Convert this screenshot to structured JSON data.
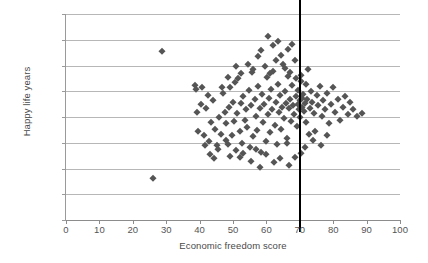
{
  "chart_data": {
    "type": "scatter",
    "title": "",
    "xlabel": "Economic freedom score",
    "ylabel": "Happy life years",
    "xlim": [
      0,
      100
    ],
    "ylim": [
      0,
      80
    ],
    "xticks": [
      0,
      10,
      20,
      30,
      40,
      50,
      60,
      70,
      80,
      90,
      100
    ],
    "xtick_labels": [
      "0",
      "10",
      "20",
      "30",
      "40",
      "50",
      "60",
      "70",
      "80",
      "90",
      "100"
    ],
    "yticks": [
      0,
      10,
      20,
      30,
      40,
      50,
      60,
      70,
      80
    ],
    "ytick_labels": [
      "0.00",
      "10.00",
      "20.00",
      "30.00",
      "40.00",
      "50.00",
      "60.00",
      "70.00",
      "80.00"
    ],
    "grid": "horizontal",
    "legend": null,
    "marker": "diamond",
    "marker_color": "#555555",
    "annotations": [
      {
        "name": "vertical-reference-line",
        "type": "vline",
        "x": 70,
        "color": "#000000",
        "width_px": 2.4
      }
    ],
    "points": [
      [
        26.0,
        16.5
      ],
      [
        28.8,
        65.5
      ],
      [
        38.5,
        52.3
      ],
      [
        38.9,
        51.0
      ],
      [
        39.2,
        41.8
      ],
      [
        40.5,
        45.0
      ],
      [
        41.2,
        33.0
      ],
      [
        42.0,
        43.5
      ],
      [
        42.8,
        30.5
      ],
      [
        43.5,
        38.0
      ],
      [
        44.0,
        46.5
      ],
      [
        44.6,
        35.5
      ],
      [
        45.2,
        29.0
      ],
      [
        45.8,
        40.0
      ],
      [
        46.4,
        33.5
      ],
      [
        47.0,
        49.5
      ],
      [
        47.5,
        42.0
      ],
      [
        48.0,
        37.5
      ],
      [
        48.4,
        29.5
      ],
      [
        48.8,
        44.0
      ],
      [
        49.2,
        51.5
      ],
      [
        49.6,
        33.0
      ],
      [
        50.0,
        46.0
      ],
      [
        50.3,
        38.5
      ],
      [
        50.8,
        27.0
      ],
      [
        51.2,
        41.5
      ],
      [
        51.6,
        55.0
      ],
      [
        52.0,
        34.5
      ],
      [
        52.4,
        45.5
      ],
      [
        52.8,
        30.0
      ],
      [
        53.1,
        48.0
      ],
      [
        53.5,
        39.0
      ],
      [
        53.9,
        43.0
      ],
      [
        54.3,
        36.0
      ],
      [
        54.7,
        50.5
      ],
      [
        55.0,
        28.5
      ],
      [
        55.4,
        44.5
      ],
      [
        55.8,
        57.5
      ],
      [
        56.1,
        32.5
      ],
      [
        56.5,
        47.0
      ],
      [
        56.9,
        40.5
      ],
      [
        57.2,
        35.0
      ],
      [
        57.6,
        52.0
      ],
      [
        58.0,
        43.5
      ],
      [
        58.3,
        26.5
      ],
      [
        58.7,
        49.0
      ],
      [
        59.0,
        38.0
      ],
      [
        59.4,
        45.0
      ],
      [
        59.8,
        30.5
      ],
      [
        60.1,
        55.5
      ],
      [
        60.4,
        41.0
      ],
      [
        60.8,
        47.5
      ],
      [
        61.1,
        34.0
      ],
      [
        61.5,
        51.0
      ],
      [
        61.8,
        43.0
      ],
      [
        62.1,
        58.0
      ],
      [
        62.5,
        37.0
      ],
      [
        62.8,
        46.0
      ],
      [
        63.1,
        29.5
      ],
      [
        63.5,
        53.0
      ],
      [
        63.8,
        42.0
      ],
      [
        64.1,
        48.5
      ],
      [
        64.4,
        35.5
      ],
      [
        64.8,
        44.0
      ],
      [
        65.1,
        60.5
      ],
      [
        65.4,
        39.5
      ],
      [
        65.7,
        50.0
      ],
      [
        66.0,
        45.5
      ],
      [
        66.3,
        32.0
      ],
      [
        66.6,
        56.0
      ],
      [
        66.9,
        43.5
      ],
      [
        67.2,
        47.0
      ],
      [
        67.5,
        38.5
      ],
      [
        67.8,
        52.5
      ],
      [
        68.0,
        44.5
      ],
      [
        68.3,
        41.0
      ],
      [
        68.6,
        62.0
      ],
      [
        68.9,
        48.0
      ],
      [
        69.1,
        36.5
      ],
      [
        69.4,
        45.0
      ],
      [
        69.6,
        50.5
      ],
      [
        69.8,
        43.0
      ],
      [
        70.0,
        46.5
      ],
      [
        70.2,
        40.0
      ],
      [
        70.4,
        54.0
      ],
      [
        70.6,
        47.5
      ],
      [
        70.8,
        44.0
      ],
      [
        71.0,
        49.0
      ],
      [
        71.3,
        42.5
      ],
      [
        71.6,
        45.5
      ],
      [
        71.9,
        38.0
      ],
      [
        72.2,
        47.0
      ],
      [
        72.6,
        58.5
      ],
      [
        73.0,
        43.5
      ],
      [
        73.4,
        50.0
      ],
      [
        73.8,
        46.0
      ],
      [
        74.2,
        41.5
      ],
      [
        74.6,
        34.5
      ],
      [
        75.0,
        48.5
      ],
      [
        75.5,
        44.5
      ],
      [
        76.0,
        52.0
      ],
      [
        76.5,
        40.5
      ],
      [
        77.0,
        46.5
      ],
      [
        77.6,
        43.0
      ],
      [
        78.2,
        49.5
      ],
      [
        78.8,
        37.5
      ],
      [
        79.4,
        45.0
      ],
      [
        80.0,
        51.5
      ],
      [
        80.6,
        42.0
      ],
      [
        81.3,
        47.0
      ],
      [
        82.0,
        39.0
      ],
      [
        82.8,
        44.0
      ],
      [
        83.5,
        48.0
      ],
      [
        84.3,
        41.0
      ],
      [
        85.0,
        46.0
      ],
      [
        86.0,
        43.0
      ],
      [
        87.0,
        40.5
      ],
      [
        88.5,
        41.5
      ],
      [
        60.5,
        71.5
      ],
      [
        62.0,
        68.0
      ],
      [
        64.5,
        64.0
      ],
      [
        57.5,
        63.5
      ],
      [
        66.5,
        66.5
      ],
      [
        59.5,
        60.0
      ],
      [
        61.0,
        57.0
      ],
      [
        63.0,
        62.0
      ],
      [
        65.5,
        59.0
      ],
      [
        58.5,
        66.0
      ],
      [
        67.0,
        57.5
      ],
      [
        54.5,
        60.5
      ],
      [
        56.0,
        58.5
      ],
      [
        52.5,
        57.0
      ],
      [
        50.5,
        53.5
      ],
      [
        48.5,
        55.5
      ],
      [
        46.8,
        51.5
      ],
      [
        69.0,
        55.0
      ],
      [
        70.5,
        56.5
      ],
      [
        72.0,
        53.0
      ],
      [
        62.3,
        22.5
      ],
      [
        58.2,
        20.5
      ],
      [
        55.5,
        23.0
      ],
      [
        52.0,
        24.5
      ],
      [
        66.8,
        21.5
      ],
      [
        60.0,
        25.5
      ],
      [
        49.0,
        25.0
      ],
      [
        64.0,
        24.0
      ],
      [
        57.0,
        27.5
      ],
      [
        53.0,
        26.0
      ],
      [
        45.5,
        27.5
      ],
      [
        43.0,
        25.5
      ],
      [
        70.3,
        26.0
      ],
      [
        71.5,
        28.5
      ],
      [
        68.5,
        24.5
      ],
      [
        74.0,
        31.0
      ],
      [
        76.2,
        29.0
      ],
      [
        72.8,
        33.5
      ],
      [
        78.0,
        33.0
      ],
      [
        66.2,
        30.0
      ],
      [
        40.8,
        51.5
      ],
      [
        41.5,
        29.0
      ],
      [
        47.8,
        31.0
      ],
      [
        44.2,
        24.0
      ],
      [
        39.5,
        34.5
      ],
      [
        42.5,
        48.5
      ],
      [
        50.8,
        60.0
      ],
      [
        67.6,
        68.5
      ],
      [
        63.6,
        69.5
      ]
    ]
  }
}
